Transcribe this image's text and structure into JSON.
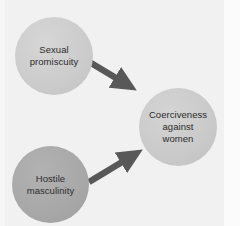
{
  "figure": {
    "background_color": "#f1f1f1",
    "width": 240,
    "height": 226
  },
  "nodes": [
    {
      "id": "sexual-promiscuity",
      "label": "Sexual\npromiscuity",
      "shape": "circle",
      "fill": "#cccccc",
      "text_color": "#2b2b2b",
      "cx": 54,
      "cy": 56,
      "diameter": 78
    },
    {
      "id": "hostile-masculinity",
      "label": "Hostile\nmasculinity",
      "shape": "circle",
      "fill": "#a8a8a8",
      "text_color": "#2b2b2b",
      "cx": 50,
      "cy": 184,
      "diameter": 77
    },
    {
      "id": "coerciveness-against-women",
      "label": "Coerciveness\nagainst\nwomen",
      "shape": "circle",
      "fill": "#cacaca",
      "text_color": "#2b2b2b",
      "cx": 178,
      "cy": 127,
      "diameter": 78
    }
  ],
  "arrows": [
    {
      "id": "promiscuity-to-coerciveness",
      "from": "sexual-promiscuity",
      "to": "coerciveness-against-women",
      "color": "#585858",
      "x1": 86,
      "y1": 60,
      "x2": 133,
      "y2": 88
    },
    {
      "id": "hostile-to-coerciveness",
      "from": "hostile-masculinity",
      "to": "coerciveness-against-women",
      "color": "#585858",
      "x1": 89,
      "y1": 182,
      "x2": 140,
      "y2": 151
    }
  ]
}
